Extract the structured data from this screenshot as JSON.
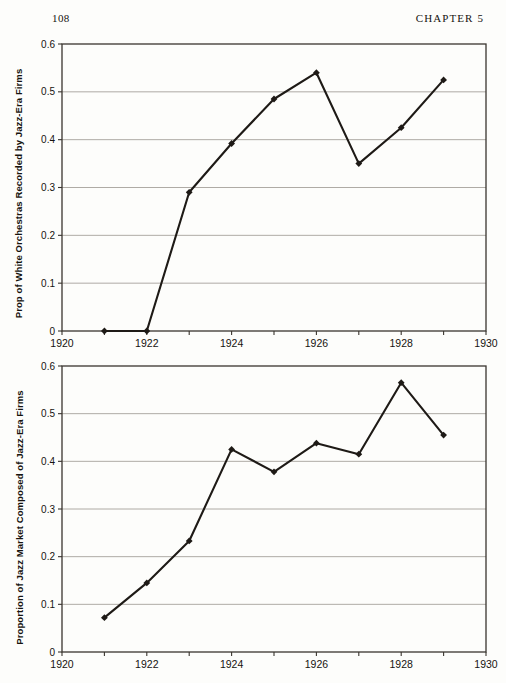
{
  "page": {
    "folio": "108",
    "running_head": "CHAPTER 5",
    "background_color": "#fdfdfb",
    "ink_color": "#16130f"
  },
  "chart_data": [
    {
      "id": "chart-top",
      "type": "line",
      "title": "",
      "xlabel": "",
      "ylabel": "Prop of White Orchestras Recorded by Jazz-Era Firms",
      "x": [
        1921,
        1922,
        1923,
        1924,
        1925,
        1926,
        1927,
        1928,
        1929
      ],
      "values": [
        0.0,
        0.0,
        0.29,
        0.392,
        0.485,
        0.54,
        0.35,
        0.425,
        0.525
      ],
      "xlim": [
        1920,
        1930
      ],
      "ylim": [
        0,
        0.6
      ],
      "xticks": [
        1920,
        1921,
        1922,
        1923,
        1924,
        1925,
        1926,
        1927,
        1928,
        1929,
        1930
      ],
      "xticklabels": [
        "1920",
        "",
        "1922",
        "",
        "1924",
        "",
        "1926",
        "",
        "1928",
        "",
        "1930"
      ],
      "yticks": [
        0,
        0.1,
        0.2,
        0.3,
        0.4,
        0.5,
        0.6
      ],
      "yticklabels": [
        "0",
        "0.1",
        "0.2",
        "0.3",
        "0.4",
        "0.5",
        "0.6"
      ],
      "grid": "horizontal",
      "legend": "none",
      "marker": "diamond",
      "line_color": "#1e1a16",
      "grid_color": "#9a968f"
    },
    {
      "id": "chart-bottom",
      "type": "line",
      "title": "",
      "xlabel": "",
      "ylabel": "Proportion of Jazz Market Composed of Jazz-Era Firms",
      "x": [
        1921,
        1922,
        1923,
        1924,
        1925,
        1926,
        1927,
        1928,
        1929
      ],
      "values": [
        0.072,
        0.145,
        0.233,
        0.425,
        0.378,
        0.438,
        0.415,
        0.565,
        0.455
      ],
      "xlim": [
        1920,
        1930
      ],
      "ylim": [
        0,
        0.6
      ],
      "xticks": [
        1920,
        1921,
        1922,
        1923,
        1924,
        1925,
        1926,
        1927,
        1928,
        1929,
        1930
      ],
      "xticklabels": [
        "1920",
        "",
        "1922",
        "",
        "1924",
        "",
        "1926",
        "",
        "1928",
        "",
        "1930"
      ],
      "yticks": [
        0,
        0.1,
        0.2,
        0.3,
        0.4,
        0.5,
        0.6
      ],
      "yticklabels": [
        "0",
        "0.1",
        "0.2",
        "0.3",
        "0.4",
        "0.5",
        "0.6"
      ],
      "grid": "horizontal",
      "legend": "none",
      "marker": "diamond",
      "line_color": "#1e1a16",
      "grid_color": "#9a968f"
    }
  ]
}
